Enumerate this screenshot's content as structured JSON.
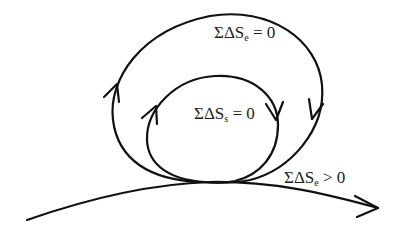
{
  "diagram": {
    "type": "entropy-cycle-diagram",
    "stroke_color": "#111111",
    "background_color": "#ffffff",
    "labels": {
      "outer_loop": {
        "prefix": "ΣΔS",
        "subscript": "e",
        "relation": "= 0"
      },
      "inner_loop": {
        "prefix": "ΣΔS",
        "subscript": "s",
        "relation": "= 0"
      },
      "base_path": {
        "prefix": "ΣΔS",
        "subscript": "e",
        "relation": "> 0"
      }
    },
    "elements": [
      {
        "id": "outer-loop",
        "kind": "closed-cycle",
        "direction": "clockwise",
        "label_ref": "outer_loop"
      },
      {
        "id": "inner-loop",
        "kind": "closed-cycle",
        "direction": "clockwise",
        "label_ref": "inner_loop"
      },
      {
        "id": "base-path",
        "kind": "open-path-with-arrow",
        "direction": "left-to-right",
        "label_ref": "base_path"
      }
    ]
  }
}
